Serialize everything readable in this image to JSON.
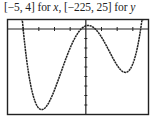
{
  "caption": {
    "prefix": "[−5, 4] for ",
    "xvar": "x",
    "middle": ", [−225, 25] for ",
    "yvar": "y"
  },
  "chart_data": {
    "type": "line",
    "title": "[−5, 4] for x, [−225, 25] for y",
    "xlabel": "x",
    "ylabel": "y",
    "xlim": [
      -5,
      4
    ],
    "ylim": [
      -225,
      25
    ],
    "grid": false,
    "axis_ticks": {
      "x_step": 1,
      "y_step": 25
    },
    "series": [
      {
        "name": "quartic curve",
        "x": [
          -4.0,
          -3.5,
          -3.0,
          -2.7,
          -2.5,
          -2.0,
          -1.5,
          -1.0,
          -0.5,
          0.0,
          0.5,
          1.0,
          1.5,
          2.0,
          2.5,
          3.0,
          3.5
        ],
        "y": [
          0,
          -158,
          -207,
          -210,
          -206,
          -170,
          -112,
          -50,
          -8,
          8,
          -3,
          -36,
          -72,
          -96,
          -92,
          -52,
          0
        ]
      }
    ],
    "features": {
      "x_intercepts": [
        -4,
        -0.3,
        0.6,
        3.5
      ],
      "local_minima": [
        {
          "x": -2.7,
          "y": -210
        },
        {
          "x": 2.1,
          "y": -96
        }
      ],
      "local_maximum": {
        "x": 0.1,
        "y": 8
      }
    }
  },
  "colors": {
    "curve": "#222222",
    "frame": "#222222",
    "background": "#ffffff"
  }
}
